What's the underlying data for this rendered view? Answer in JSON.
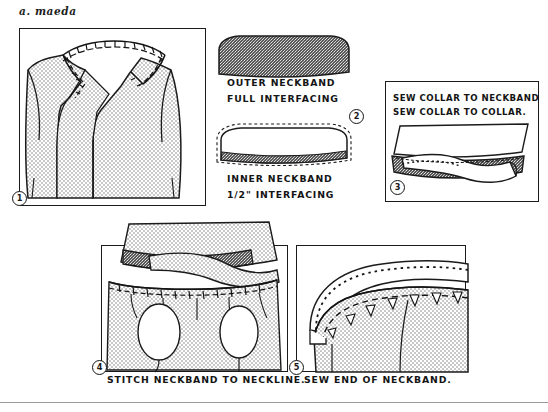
{
  "sheet": {
    "title": "a. maeda",
    "background_color": "#ffffff",
    "ink_color": "#1a1a1a",
    "fabric_fill_color": "#d8d8d8",
    "interfacing_fill_color": "#4a4a4a"
  },
  "panels": [
    {
      "id": "panel-1",
      "step_number": "1",
      "caption": "",
      "subject": "bodice-front-with-clipped-neckline"
    },
    {
      "id": "panel-2",
      "step_number": "2",
      "caption": "",
      "subject": "neckband-pieces",
      "labels": [
        "OUTER NECKBAND",
        "FULL INTERFACING",
        "INNER NECKBAND",
        "1/2\" INTERFACING"
      ]
    },
    {
      "id": "panel-3",
      "step_number": "3",
      "caption": "",
      "subject": "collar-sewn-to-neckband",
      "labels": [
        "SEW COLLAR TO NECKBAND",
        "SEW COLLAR TO COLLAR."
      ]
    },
    {
      "id": "panel-4",
      "step_number": "4",
      "caption": "STITCH NECKBAND TO NECKLINE.",
      "subject": "neckband-stitched-to-neckline-with-darts"
    },
    {
      "id": "panel-5",
      "step_number": "5",
      "caption": "SEW END OF NECKBAND.",
      "subject": "neckband-end-closeup-with-notches"
    }
  ],
  "labels": {
    "outer_neckband": "OUTER NECKBAND",
    "full_interfacing": "FULL INTERFACING",
    "inner_neckband": "INNER NECKBAND",
    "half_inch_interfacing": "1/2\" INTERFACING",
    "sew_collar_to_neckband": "SEW COLLAR TO NECKBAND",
    "sew_collar_to_collar": "SEW COLLAR TO COLLAR.",
    "stitch_neckband_to_neckline": "STITCH NECKBAND TO NECKLINE.",
    "sew_end_of_neckband": "SEW END OF NECKBAND."
  },
  "steps": {
    "one": "1",
    "two": "2",
    "three": "3",
    "four": "4",
    "five": "5"
  }
}
